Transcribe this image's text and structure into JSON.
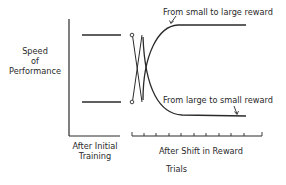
{
  "diagram": {
    "y_axis_label": [
      "Speed",
      "of",
      "Performance"
    ],
    "x_axis_title": "Trials",
    "phases": [
      {
        "label": [
          "After Initial",
          "Training"
        ]
      },
      {
        "label": [
          "After Shift in Reward"
        ]
      }
    ],
    "annotations": [
      {
        "text": "From small to large reward",
        "target": "upper-curve"
      },
      {
        "text": "From large to small reward",
        "target": "lower-curve"
      }
    ],
    "initial_training_levels": [
      "high (large reward)",
      "low (small reward)"
    ],
    "tick_count": 10,
    "colors": {
      "line": "#2a2a2a",
      "background": "#ffffff"
    }
  }
}
